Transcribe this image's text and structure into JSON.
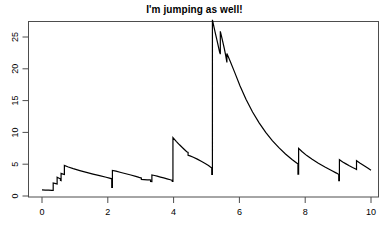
{
  "chart": {
    "title": "I'm jumping as well!",
    "line_color": "#000000",
    "axis_color": "#4d4d4d",
    "background": "#ffffff"
  },
  "chart_data": {
    "type": "line",
    "title": "I'm jumping as well!",
    "xlabel": "",
    "ylabel": "",
    "xlim": [
      0,
      10
    ],
    "ylim": [
      0,
      28
    ],
    "grid": false,
    "legend": null,
    "xticks": [
      0,
      2,
      4,
      6,
      8,
      10
    ],
    "yticks": [
      0,
      5,
      10,
      15,
      20,
      25
    ],
    "series": [
      {
        "name": "intensity",
        "points": [
          [
            0.0,
            0.95
          ],
          [
            0.1,
            0.93
          ],
          [
            0.2,
            0.92
          ],
          [
            0.3,
            0.9
          ],
          [
            0.34,
            0.88
          ],
          [
            0.34,
            2.05
          ],
          [
            0.42,
            1.95
          ],
          [
            0.46,
            1.88
          ],
          [
            0.46,
            2.95
          ],
          [
            0.52,
            2.8
          ],
          [
            0.56,
            2.7
          ],
          [
            0.56,
            2.45
          ],
          [
            0.58,
            2.42
          ],
          [
            0.58,
            3.55
          ],
          [
            0.64,
            3.45
          ],
          [
            0.68,
            3.38
          ],
          [
            0.68,
            4.8
          ],
          [
            0.8,
            4.55
          ],
          [
            0.95,
            4.3
          ],
          [
            1.15,
            4.0
          ],
          [
            1.35,
            3.72
          ],
          [
            1.55,
            3.45
          ],
          [
            1.75,
            3.2
          ],
          [
            1.95,
            2.95
          ],
          [
            2.05,
            2.8
          ],
          [
            2.12,
            2.7
          ],
          [
            2.12,
            1.35
          ],
          [
            2.14,
            1.35
          ],
          [
            2.14,
            4.02
          ],
          [
            2.25,
            3.9
          ],
          [
            2.4,
            3.7
          ],
          [
            2.55,
            3.5
          ],
          [
            2.7,
            3.3
          ],
          [
            2.85,
            3.08
          ],
          [
            2.95,
            2.92
          ],
          [
            3.0,
            2.85
          ],
          [
            3.02,
            2.82
          ],
          [
            3.02,
            2.6
          ],
          [
            3.1,
            2.58
          ],
          [
            3.2,
            2.55
          ],
          [
            3.28,
            2.52
          ],
          [
            3.3,
            2.5
          ],
          [
            3.3,
            2.28
          ],
          [
            3.34,
            2.26
          ],
          [
            3.34,
            3.3
          ],
          [
            3.42,
            3.22
          ],
          [
            3.5,
            3.12
          ],
          [
            3.6,
            2.98
          ],
          [
            3.7,
            2.85
          ],
          [
            3.8,
            2.7
          ],
          [
            3.9,
            2.55
          ],
          [
            3.96,
            2.45
          ],
          [
            3.96,
            2.28
          ],
          [
            3.98,
            2.28
          ],
          [
            3.98,
            9.2
          ],
          [
            4.08,
            8.6
          ],
          [
            4.18,
            8.05
          ],
          [
            4.28,
            7.55
          ],
          [
            4.36,
            7.15
          ],
          [
            4.4,
            6.95
          ],
          [
            4.44,
            6.85
          ],
          [
            4.44,
            6.4
          ],
          [
            4.5,
            6.3
          ],
          [
            4.6,
            6.1
          ],
          [
            4.72,
            5.8
          ],
          [
            4.84,
            5.45
          ],
          [
            4.96,
            5.1
          ],
          [
            5.06,
            4.8
          ],
          [
            5.12,
            4.55
          ],
          [
            5.16,
            4.4
          ],
          [
            5.16,
            3.4
          ],
          [
            5.18,
            3.4
          ],
          [
            5.18,
            27.7
          ],
          [
            5.26,
            25.8
          ],
          [
            5.34,
            24.0
          ],
          [
            5.4,
            22.6
          ],
          [
            5.42,
            22.3
          ],
          [
            5.42,
            25.9
          ],
          [
            5.48,
            24.6
          ],
          [
            5.54,
            23.2
          ],
          [
            5.58,
            22.2
          ],
          [
            5.6,
            21.6
          ],
          [
            5.62,
            21.0
          ],
          [
            5.62,
            22.4
          ],
          [
            5.72,
            21.2
          ],
          [
            5.86,
            19.4
          ],
          [
            6.02,
            17.3
          ],
          [
            6.2,
            15.2
          ],
          [
            6.4,
            13.2
          ],
          [
            6.6,
            11.5
          ],
          [
            6.8,
            10.0
          ],
          [
            7.0,
            8.7
          ],
          [
            7.2,
            7.6
          ],
          [
            7.4,
            6.6
          ],
          [
            7.6,
            5.75
          ],
          [
            7.74,
            5.2
          ],
          [
            7.78,
            5.05
          ],
          [
            7.78,
            3.45
          ],
          [
            7.8,
            3.45
          ],
          [
            7.8,
            7.5
          ],
          [
            7.9,
            7.0
          ],
          [
            8.05,
            6.35
          ],
          [
            8.2,
            5.8
          ],
          [
            8.4,
            5.15
          ],
          [
            8.6,
            4.55
          ],
          [
            8.8,
            4.0
          ],
          [
            8.95,
            3.6
          ],
          [
            9.0,
            3.45
          ],
          [
            9.02,
            3.4
          ],
          [
            9.02,
            2.42
          ],
          [
            9.04,
            2.42
          ],
          [
            9.04,
            5.7
          ],
          [
            9.14,
            5.35
          ],
          [
            9.24,
            5.05
          ],
          [
            9.34,
            4.75
          ],
          [
            9.44,
            4.48
          ],
          [
            9.52,
            4.28
          ],
          [
            9.56,
            4.18
          ],
          [
            9.56,
            5.55
          ],
          [
            9.66,
            5.2
          ],
          [
            9.78,
            4.8
          ],
          [
            9.9,
            4.4
          ],
          [
            10.0,
            4.05
          ]
        ]
      }
    ]
  }
}
